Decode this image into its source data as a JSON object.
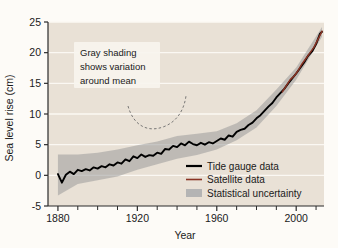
{
  "chart_data": {
    "type": "line",
    "title": "",
    "xlabel": "Year",
    "ylabel": "Sea level rise (cm)",
    "xlim": [
      1875,
      2014
    ],
    "ylim": [
      -5,
      25
    ],
    "xticks_major": [
      1880,
      1920,
      1960,
      2000
    ],
    "xticks_minor": [
      1890,
      1900,
      1910,
      1930,
      1940,
      1950,
      1970,
      1980,
      1990,
      2010
    ],
    "yticks": [
      -5,
      0,
      5,
      10,
      15,
      20,
      25
    ],
    "grid": "horizontal-white",
    "legend_position": "inside-lower-right",
    "annotation": {
      "lines": [
        "Gray shading",
        "shows variation",
        "around mean"
      ],
      "leader": "curved-dashed"
    },
    "series": [
      {
        "name": "Tide gauge data",
        "color": "#000000",
        "x": [
          1880,
          1882,
          1884,
          1886,
          1888,
          1890,
          1892,
          1894,
          1896,
          1898,
          1900,
          1902,
          1904,
          1906,
          1908,
          1910,
          1912,
          1914,
          1916,
          1918,
          1920,
          1922,
          1924,
          1926,
          1928,
          1930,
          1932,
          1934,
          1936,
          1938,
          1940,
          1942,
          1944,
          1946,
          1948,
          1950,
          1952,
          1954,
          1956,
          1958,
          1960,
          1962,
          1964,
          1966,
          1968,
          1970,
          1972,
          1974,
          1976,
          1978,
          1980,
          1982,
          1984,
          1986,
          1988,
          1990,
          1992,
          1994,
          1996,
          1998,
          2000,
          2002,
          2004,
          2006,
          2008,
          2010,
          2012,
          2013
        ],
        "values": [
          0.2,
          -1.2,
          0.1,
          0.6,
          0.2,
          0.9,
          0.7,
          1.0,
          0.8,
          1.3,
          1.1,
          1.5,
          1.3,
          1.8,
          1.6,
          2.1,
          1.9,
          2.6,
          2.3,
          3.1,
          2.8,
          3.4,
          3.0,
          3.3,
          3.2,
          3.7,
          3.5,
          4.3,
          4.2,
          4.8,
          4.6,
          5.2,
          4.9,
          5.5,
          5.1,
          4.9,
          5.3,
          5.0,
          5.4,
          5.2,
          5.6,
          6.0,
          5.8,
          6.5,
          6.3,
          7.1,
          7.4,
          7.6,
          8.2,
          8.6,
          9.3,
          9.8,
          10.5,
          11.2,
          11.8,
          12.7,
          13.4,
          14.1,
          15.0,
          15.8,
          16.6,
          17.5,
          18.4,
          19.5,
          20.2,
          21.4,
          23.1,
          23.4
        ]
      },
      {
        "name": "Satellite data",
        "color": "#8a3324",
        "x": [
          1993,
          1995,
          1997,
          1999,
          2001,
          2003,
          2005,
          2007,
          2009,
          2011,
          2013
        ],
        "values": [
          13.6,
          14.6,
          15.6,
          16.2,
          17.1,
          18.2,
          19.1,
          20.0,
          20.9,
          22.2,
          23.5
        ]
      }
    ],
    "uncertainty": {
      "name": "Statistical uncertainty",
      "color": "#9a9a9a",
      "x": [
        1880,
        1890,
        1900,
        1910,
        1920,
        1930,
        1940,
        1950,
        1960,
        1970,
        1980,
        1990,
        2000,
        2013
      ],
      "lower": [
        -3.3,
        -1.4,
        -0.8,
        -0.2,
        0.9,
        1.8,
        2.7,
        3.3,
        4.2,
        5.7,
        7.8,
        11.3,
        15.6,
        22.6
      ],
      "upper": [
        3.4,
        3.4,
        3.7,
        4.2,
        4.9,
        5.5,
        6.4,
        6.8,
        7.2,
        8.5,
        10.6,
        14.0,
        17.6,
        24.2
      ]
    }
  },
  "legend": {
    "items": [
      {
        "label": "Tide gauge data",
        "marker": "line",
        "color": "#000000"
      },
      {
        "label": "Satellite data",
        "marker": "line",
        "color": "#8a3324"
      },
      {
        "label": "Statistical uncertainty",
        "marker": "swatch",
        "color": "#b4b4b4"
      }
    ]
  },
  "colors": {
    "plot_background": "#e9e1d6",
    "page_background": "#fdfbf7",
    "gridline": "#fbf8f3",
    "axis": "#2b2b2b",
    "tide": "#000000",
    "satellite": "#8a3324",
    "band": "#9a9a9a",
    "annotation_box": "#f7f4ee"
  }
}
